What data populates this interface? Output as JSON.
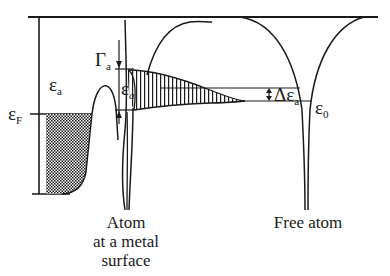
{
  "diagram": {
    "type": "energy-level diagram",
    "labels": {
      "epsilon_a_left": {
        "main": "ε",
        "sub": "a"
      },
      "epsilon_F": {
        "main": "ε",
        "sub": "F"
      },
      "gamma_a": {
        "main": "Γ",
        "sub": "a"
      },
      "epsilon_a_level": {
        "main": "ε",
        "sub": "a"
      },
      "delta_epsilon_a": {
        "main": "Δε",
        "sub": "a"
      },
      "epsilon_0": {
        "main": "ε",
        "sub": "0"
      }
    },
    "captions": {
      "atom_surface": [
        "Atom",
        "at a metal",
        "surface"
      ],
      "free_atom": "Free atom"
    },
    "regions": {
      "metal_filled_band": "cross-hatched (occupied states below Fermi level)",
      "broadened_level": "vertical hatching (Lorentzian-broadened adsorbate level)"
    },
    "colors": {
      "ink": "#1a1a1a",
      "background": "#ffffff"
    }
  }
}
